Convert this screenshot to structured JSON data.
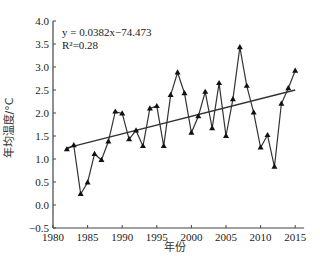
{
  "chart_data": {
    "type": "line",
    "title": "",
    "xlabel": "年份",
    "ylabel": "年均温度/°C",
    "xlim": [
      1980,
      2016
    ],
    "ylim": [
      -0.5,
      4.0
    ],
    "x_ticks": [
      1980,
      1985,
      1990,
      1995,
      2000,
      2005,
      2010,
      2015
    ],
    "y_ticks": [
      -0.5,
      0.0,
      0.5,
      1.0,
      1.5,
      2.0,
      2.5,
      3.0,
      3.5,
      4.0
    ],
    "y_tick_labels": [
      "−0.5",
      "0.0",
      "0.5",
      "1.0",
      "1.5",
      "2.0",
      "2.5",
      "3.0",
      "3.5",
      "4.0"
    ],
    "grid": false,
    "legend": null,
    "x": [
      1982,
      1983,
      1984,
      1985,
      1986,
      1987,
      1988,
      1989,
      1990,
      1991,
      1992,
      1993,
      1994,
      1995,
      1996,
      1997,
      1998,
      1999,
      2000,
      2001,
      2002,
      2003,
      2004,
      2005,
      2006,
      2007,
      2008,
      2009,
      2010,
      2011,
      2012,
      2013,
      2014,
      2015
    ],
    "series": [
      {
        "name": "年均温度",
        "marker": "triangle",
        "values": [
          1.21,
          1.3,
          0.24,
          0.49,
          1.11,
          0.98,
          1.38,
          2.03,
          1.99,
          1.43,
          1.62,
          1.28,
          2.1,
          2.15,
          1.28,
          2.39,
          2.88,
          2.43,
          1.57,
          1.93,
          2.46,
          1.67,
          2.65,
          1.5,
          2.3,
          3.43,
          2.59,
          2.01,
          1.25,
          1.52,
          0.83,
          2.2,
          2.54,
          2.92
        ]
      },
      {
        "name": "线性趋势",
        "type": "trendline",
        "slope": 0.0382,
        "intercept": -74.473,
        "x_range": [
          1982,
          2015
        ]
      }
    ],
    "annotations": {
      "equation": "y = 0.0382x−74.473",
      "r_squared": "R²=0.28"
    }
  },
  "caption": ""
}
